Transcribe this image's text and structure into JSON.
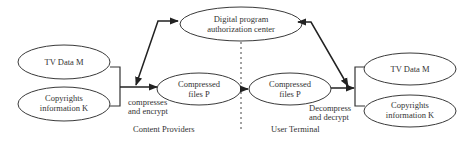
{
  "diagram": {
    "nodes": {
      "auth_center": {
        "line1": "Digital program",
        "line2": "authorization center"
      },
      "tv_data_left": {
        "line1": "TV Data M"
      },
      "copyright_left": {
        "line1": "Copyrights",
        "line2": "information K"
      },
      "compressed_left": {
        "line1": "Compressed",
        "line2": "files P"
      },
      "compressed_right": {
        "line1": "Compressed",
        "line2": "files P"
      },
      "tv_data_right": {
        "line1": "TV Data M"
      },
      "copyright_right": {
        "line1": "Copyrights",
        "line2": "information K"
      }
    },
    "edge_labels": {
      "compress_encrypt": {
        "line1": "compresses",
        "line2": "and encrypt"
      },
      "decompress_decrypt": {
        "line1": "Decompress",
        "line2": "and decrypt"
      }
    },
    "regions": {
      "left": "Content Providers",
      "right": "User Terminal"
    }
  }
}
